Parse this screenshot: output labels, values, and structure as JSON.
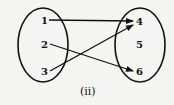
{
  "diagram": {
    "caption": "(ii)",
    "domain_set": [
      "1",
      "2",
      "3"
    ],
    "codomain_set": [
      "4",
      "5",
      "6"
    ],
    "mappings": [
      {
        "from": "1",
        "to": "4"
      },
      {
        "from": "2",
        "to": "6"
      },
      {
        "from": "3",
        "to": "4"
      }
    ],
    "colors": {
      "stroke": "#111111",
      "background": "#f4f4f2"
    }
  }
}
